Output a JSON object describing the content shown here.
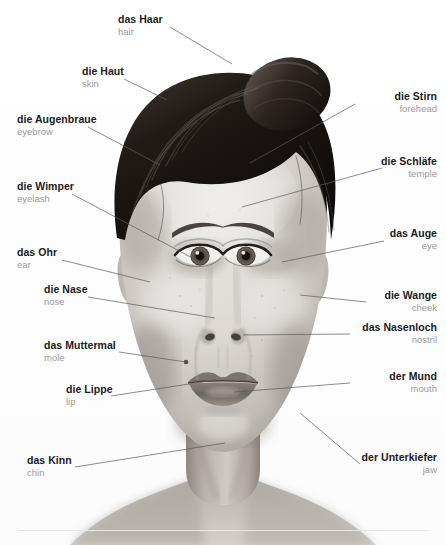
{
  "page": {
    "language_pair": "German – English",
    "background_color": "#ffffff",
    "label_color_de": "#1b1b1b",
    "label_color_en": "#9a9a9a",
    "leader_line_color": "#5a5a5a"
  },
  "image": {
    "subject": "frontal portrait of a woman with dark hair in an updo bun",
    "style": "black-and-white photograph",
    "alt": "Annotated grayscale frontal portrait used as a German vocabulary diagram of facial parts"
  },
  "labels": [
    {
      "id": "haar",
      "de": "das Haar",
      "en": "hair",
      "side": "left",
      "text_x": 118,
      "text_y": 14,
      "line": {
        "x1": 170,
        "y1": 27,
        "x2": 232,
        "y2": 64
      }
    },
    {
      "id": "haut",
      "de": "die Haut",
      "en": "skin",
      "side": "left",
      "text_x": 82,
      "text_y": 66,
      "line": {
        "x1": 124,
        "y1": 79,
        "x2": 167,
        "y2": 100
      }
    },
    {
      "id": "augenbraue",
      "de": "die Augenbraue",
      "en": "eyebrow",
      "side": "left",
      "text_x": 17,
      "text_y": 114,
      "line": {
        "x1": 88,
        "y1": 127,
        "x2": 160,
        "y2": 165
      }
    },
    {
      "id": "wimper",
      "de": "die Wimper",
      "en": "eyelash",
      "side": "left",
      "text_x": 17,
      "text_y": 181,
      "line": {
        "x1": 72,
        "y1": 194,
        "x2": 200,
        "y2": 262
      }
    },
    {
      "id": "ohr",
      "de": "das Ohr",
      "en": "ear",
      "side": "left",
      "text_x": 17,
      "text_y": 247,
      "line": {
        "x1": 62,
        "y1": 260,
        "x2": 150,
        "y2": 282
      }
    },
    {
      "id": "nase",
      "de": "die Nase",
      "en": "nose",
      "side": "left",
      "text_x": 44,
      "text_y": 284,
      "line": {
        "x1": 88,
        "y1": 297,
        "x2": 215,
        "y2": 318
      }
    },
    {
      "id": "muttermal",
      "de": "das Muttermal",
      "en": "mole",
      "side": "left",
      "text_x": 44,
      "text_y": 340,
      "line": {
        "x1": 119,
        "y1": 352,
        "x2": 186,
        "y2": 362
      }
    },
    {
      "id": "lippe",
      "de": "die Lippe",
      "en": "lip",
      "side": "left",
      "text_x": 66,
      "text_y": 384,
      "line": {
        "x1": 111,
        "y1": 396,
        "x2": 215,
        "y2": 380
      }
    },
    {
      "id": "kinn",
      "de": "das Kinn",
      "en": "chin",
      "side": "left",
      "text_x": 27,
      "text_y": 455,
      "line": {
        "x1": 75,
        "y1": 467,
        "x2": 225,
        "y2": 443
      }
    },
    {
      "id": "stirn",
      "de": "die Stirn",
      "en": "forehead",
      "side": "right",
      "text_x": 358,
      "text_y": 91,
      "line": {
        "x1": 355,
        "y1": 104,
        "x2": 250,
        "y2": 163
      }
    },
    {
      "id": "schlaefe",
      "de": "die Schläfe",
      "en": "temple",
      "side": "right",
      "text_x": 380,
      "text_y": 156,
      "line": {
        "x1": 382,
        "y1": 168,
        "x2": 242,
        "y2": 207
      }
    },
    {
      "id": "auge",
      "de": "das Auge",
      "en": "eye",
      "side": "right",
      "text_x": 388,
      "text_y": 228,
      "line": {
        "x1": 384,
        "y1": 241,
        "x2": 282,
        "y2": 262
      }
    },
    {
      "id": "wange",
      "de": "die Wange",
      "en": "cheek",
      "side": "right",
      "text_x": 369,
      "text_y": 290,
      "line": {
        "x1": 366,
        "y1": 302,
        "x2": 300,
        "y2": 295
      }
    },
    {
      "id": "nasenloch",
      "de": "das Nasenloch",
      "en": "nostril",
      "side": "right",
      "text_x": 352,
      "text_y": 322,
      "line": {
        "x1": 350,
        "y1": 334,
        "x2": 243,
        "y2": 335
      }
    },
    {
      "id": "mund",
      "de": "der Mund",
      "en": "mouth",
      "side": "right",
      "text_x": 352,
      "text_y": 371,
      "line": {
        "x1": 350,
        "y1": 383,
        "x2": 234,
        "y2": 392
      }
    },
    {
      "id": "unterkiefer",
      "de": "der Unterkiefer",
      "en": "jaw",
      "side": "right",
      "text_x": 363,
      "text_y": 452,
      "line": {
        "x1": 360,
        "y1": 464,
        "x2": 300,
        "y2": 413
      }
    }
  ]
}
